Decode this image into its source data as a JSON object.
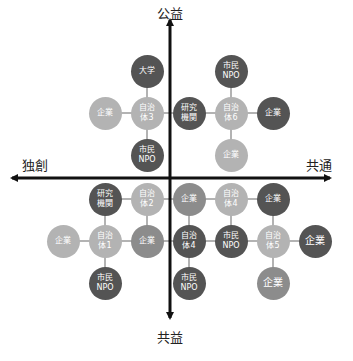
{
  "axes": {
    "top": "公益",
    "bottom": "共益",
    "left": "独創",
    "right": "共通",
    "origin": [
      170,
      178
    ]
  },
  "colors": {
    "dark": "#545454",
    "mid": "#8c8c8c",
    "light": "#b3b3b3",
    "axis": "#111111",
    "connector": "#9a9a9a"
  },
  "nodes": [
    {
      "id": "n1",
      "label": "大学",
      "x": 147,
      "y": 71,
      "tone": "dark"
    },
    {
      "id": "n2",
      "label": "企業",
      "x": 105,
      "y": 113,
      "tone": "light"
    },
    {
      "id": "n3",
      "label": "自治\n体3",
      "x": 147,
      "y": 113,
      "tone": "light"
    },
    {
      "id": "n4",
      "label": "研究\n機関",
      "x": 189,
      "y": 113,
      "tone": "dark"
    },
    {
      "id": "n5",
      "label": "市民\nNPO",
      "x": 147,
      "y": 155,
      "tone": "dark"
    },
    {
      "id": "n6",
      "label": "市民\nNPO",
      "x": 231,
      "y": 71,
      "tone": "dark"
    },
    {
      "id": "n7",
      "label": "自治\n体6",
      "x": 231,
      "y": 113,
      "tone": "light"
    },
    {
      "id": "n8",
      "label": "企業",
      "x": 273,
      "y": 113,
      "tone": "dark"
    },
    {
      "id": "n9",
      "label": "企業",
      "x": 231,
      "y": 155,
      "tone": "light"
    },
    {
      "id": "n10",
      "label": "研究\n機関",
      "x": 105,
      "y": 199,
      "tone": "dark"
    },
    {
      "id": "n11",
      "label": "自治\n体2",
      "x": 147,
      "y": 199,
      "tone": "light"
    },
    {
      "id": "n12",
      "label": "企業",
      "x": 63,
      "y": 241,
      "tone": "light"
    },
    {
      "id": "n13",
      "label": "自治\n体1",
      "x": 105,
      "y": 241,
      "tone": "light"
    },
    {
      "id": "n14",
      "label": "企業",
      "x": 147,
      "y": 241,
      "tone": "mid"
    },
    {
      "id": "n15",
      "label": "市民\nNPO",
      "x": 105,
      "y": 283,
      "tone": "dark"
    },
    {
      "id": "n16",
      "label": "企業",
      "x": 189,
      "y": 199,
      "tone": "mid"
    },
    {
      "id": "n17",
      "label": "自治\n体4",
      "x": 231,
      "y": 199,
      "tone": "light"
    },
    {
      "id": "n18",
      "label": "企業",
      "x": 273,
      "y": 199,
      "tone": "dark"
    },
    {
      "id": "n19",
      "label": "自治\n体4",
      "x": 189,
      "y": 241,
      "tone": "dark"
    },
    {
      "id": "n20",
      "label": "市民\nNPO",
      "x": 231,
      "y": 241,
      "tone": "dark"
    },
    {
      "id": "n21",
      "label": "自治\n体5",
      "x": 273,
      "y": 241,
      "tone": "light"
    },
    {
      "id": "n22",
      "label": "企業",
      "x": 315,
      "y": 241,
      "tone": "dark",
      "big": true
    },
    {
      "id": "n23",
      "label": "市民\nNPO",
      "x": 189,
      "y": 283,
      "tone": "dark"
    },
    {
      "id": "n24",
      "label": "企業",
      "x": 273,
      "y": 283,
      "tone": "mid",
      "big": true
    }
  ],
  "edges": [
    [
      "n1",
      "n3"
    ],
    [
      "n2",
      "n3"
    ],
    [
      "n3",
      "n4"
    ],
    [
      "n3",
      "n5"
    ],
    [
      "n6",
      "n7"
    ],
    [
      "n4",
      "n7"
    ],
    [
      "n7",
      "n8"
    ],
    [
      "n7",
      "n9"
    ],
    [
      "n10",
      "n11"
    ],
    [
      "n10",
      "n13"
    ],
    [
      "n11",
      "n14"
    ],
    [
      "n12",
      "n13"
    ],
    [
      "n13",
      "n14"
    ],
    [
      "n13",
      "n15"
    ],
    [
      "n14",
      "n19"
    ],
    [
      "n16",
      "n17"
    ],
    [
      "n17",
      "n18"
    ],
    [
      "n16",
      "n19"
    ],
    [
      "n17",
      "n20"
    ],
    [
      "n18",
      "n21"
    ],
    [
      "n19",
      "n20"
    ],
    [
      "n20",
      "n21"
    ],
    [
      "n21",
      "n22"
    ],
    [
      "n21",
      "n24"
    ],
    [
      "n19",
      "n23"
    ],
    [
      "n11",
      "n16"
    ]
  ]
}
